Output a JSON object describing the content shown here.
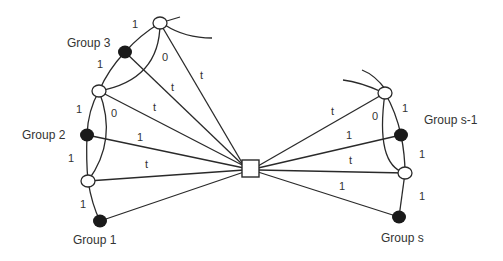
{
  "diagram": {
    "groups": [
      {
        "label": "Group 3"
      },
      {
        "label": "Group 2"
      },
      {
        "label": "Group 1"
      },
      {
        "label": "Group s-1"
      },
      {
        "label": "Group s"
      }
    ],
    "edge_labels": {
      "l_top_g3": "1",
      "g3_lmid": "1",
      "ltop_lmid_zero": "0",
      "ltop_center": "t",
      "g3_center": "t",
      "lmid_center": "t",
      "lmid_g2": "1",
      "lmid_lbot_zero": "0",
      "g2_center": "1",
      "g2_lbot": "1",
      "lbot_center": "t",
      "lbot_g1": "1",
      "rtop_center": "t",
      "rtop_gs1": "1",
      "rtop_rbot_zero": "0",
      "gs1_center": "1",
      "gs1_rbot": "1",
      "rbot_center": "t",
      "rbot_gs": "1",
      "gs_center": "1"
    },
    "colors": {
      "stroke": "#2a2a2a",
      "filled_node": "#1a1a1a",
      "open_node": "#ffffff"
    }
  }
}
